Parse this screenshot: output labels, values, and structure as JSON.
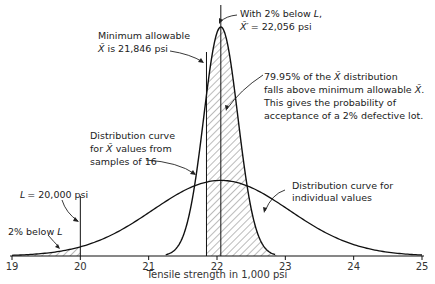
{
  "chart_data": {
    "type": "area",
    "title": "",
    "xlabel": "Tensile strength in 1,000 psi",
    "ylabel": "",
    "xlim": [
      19,
      25
    ],
    "x_ticks": [
      "19",
      "20",
      "21",
      "22",
      "23",
      "24",
      "25"
    ],
    "grid": false,
    "legend": null,
    "series": [
      {
        "name": "Distribution curve for individual values",
        "distribution": "normal",
        "mean": 22.056,
        "sd": 1.0,
        "peak_rel": 0.33
      },
      {
        "name": "Distribution curve for X-bar values from samples of 16",
        "distribution": "normal",
        "mean": 22.056,
        "sd": 0.25,
        "peak_rel": 1.0
      }
    ],
    "reference_lines": [
      {
        "name": "L",
        "x": 20.0
      },
      {
        "name": "Minimum allowable X-bar",
        "x": 21.846
      },
      {
        "name": "X-bar prime",
        "x": 22.056
      }
    ],
    "shaded_regions": [
      {
        "name": "2% below L",
        "from": 19,
        "to": 20,
        "curve": "individual"
      },
      {
        "name": "79.95% above minimum allowable X-bar",
        "from": 21.846,
        "to": 22.9,
        "curve": "sample-means"
      }
    ]
  },
  "annotations": {
    "min_allowable_1": "Minimum allowable",
    "min_allowable_2": "is 21,846 psi",
    "xbar_symbol": "X̄",
    "with2_1": "With 2% below ",
    "with2_L": "L",
    "with2_2": "= 22,056 psi",
    "xbarprime_symbol": "X̄′",
    "pct_1a": "79.95% of the ",
    "pct_1b": " distribution",
    "pct_2": "falls above minimum allowable ",
    "pct_2_end": ".",
    "pct_3": "This gives the probability of",
    "pct_4": "acceptance of a 2% defective lot.",
    "dist_samples_1": "Distribution curve",
    "dist_samples_2a": "for ",
    "dist_samples_2b": " values from",
    "dist_samples_3": "samples of 16",
    "L_label_L": "L",
    "L_label_val": "= 20,000 psi",
    "below_L_a": "2% below ",
    "below_L_b": "L",
    "dist_indiv_1": "Distribution curve for",
    "dist_indiv_2": "individual values"
  }
}
